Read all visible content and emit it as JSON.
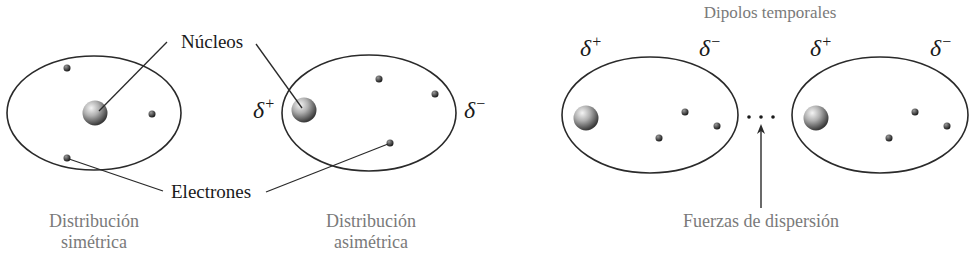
{
  "left_panel": {
    "nuclei_label": "Núcleos",
    "electrons_label": "Electrones",
    "symmetric_caption": {
      "line1": "Distribución",
      "line2": "simétrica"
    },
    "asymmetric_caption": {
      "line1": "Distribución",
      "line2": "asimétrica"
    },
    "asym_pos_charge": {
      "symbol": "δ",
      "sign": "+"
    },
    "asym_neg_charge": {
      "symbol": "δ",
      "sign": "−"
    }
  },
  "right_panel": {
    "title": "Dipolos temporales",
    "caption": "Fuerzas de dispersión",
    "dipole1_pos": {
      "symbol": "δ",
      "sign": "+"
    },
    "dipole1_neg": {
      "symbol": "δ",
      "sign": "−"
    },
    "dipole2_pos": {
      "symbol": "δ",
      "sign": "+"
    },
    "dipole2_neg": {
      "symbol": "δ",
      "sign": "−"
    }
  },
  "colors": {
    "line": "#2a2a2a",
    "label_black": "#1a1a1a",
    "caption_gray": "#7a7a7a"
  }
}
